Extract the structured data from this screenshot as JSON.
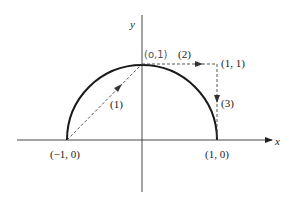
{
  "diagram": {
    "axes": {
      "x_label": "x",
      "y_label": "y"
    },
    "curve": {
      "type": "upper semicircle",
      "center": [
        0,
        0
      ],
      "radius": 1
    },
    "points": {
      "left": "(−1, 0)",
      "right": "(1, 0)",
      "top": "(o,1)",
      "corner": "(1, 1)"
    },
    "paths": [
      {
        "label": "(1)",
        "from": "(-1,0)",
        "to": "(0,1)",
        "style": "dashed",
        "direction": "up-right"
      },
      {
        "label": "(2)",
        "from": "(0,1)",
        "to": "(1,1)",
        "style": "dashed",
        "direction": "right"
      },
      {
        "label": "(3)",
        "from": "(1,1)",
        "to": "(1,0)",
        "style": "dashed",
        "direction": "down"
      }
    ],
    "colors": {
      "line": "#222222",
      "dashed": "#444444",
      "handwritten": "#666666"
    }
  }
}
